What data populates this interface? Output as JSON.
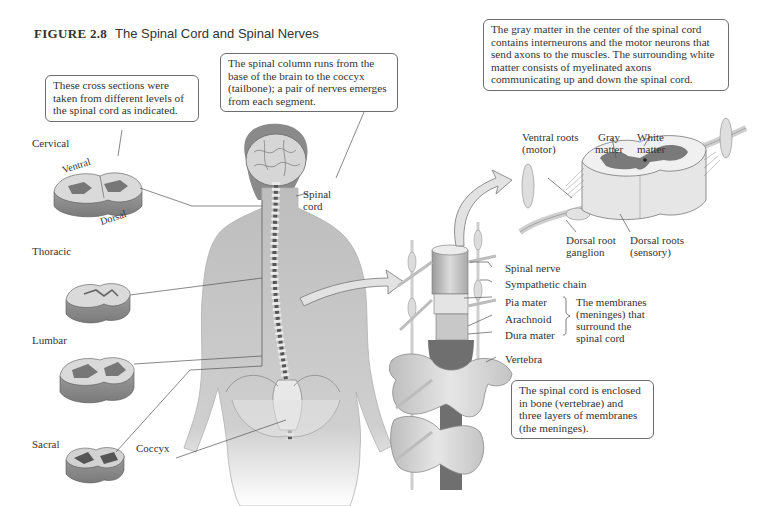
{
  "figure": {
    "number": "FIGURE 2.8",
    "title": "The Spinal Cord and Spinal Nerves"
  },
  "callouts": {
    "cross_sections": "These cross sections were taken from different levels of the spinal cord as indicated.",
    "spinal_column": "The spinal column runs from the base of the brain to the coccyx (tailbone); a pair of nerves emerges from each segment.",
    "gray_white_matter": "The gray matter in the center of the spinal cord contains interneurons and the motor neurons that send axons to the muscles. The surrounding white matter consists of myelinated axons communicating up and down the spinal cord.",
    "enclosure": "The spinal cord is enclosed in bone (vertebrae) and three layers of membranes (the meninges)."
  },
  "levels": {
    "cervical": "Cervical",
    "thoracic": "Thoracic",
    "lumbar": "Lumbar",
    "sacral": "Sacral"
  },
  "orientation": {
    "ventral": "Ventral",
    "dorsal": "Dorsal"
  },
  "body_labels": {
    "spinal_cord_1": "Spinal",
    "spinal_cord_2": "cord",
    "coccyx": "Coccyx"
  },
  "cord_section_labels": {
    "ventral_roots_1": "Ventral roots",
    "ventral_roots_2": "(motor)",
    "gray_matter_1": "Gray",
    "gray_matter_2": "matter",
    "white_matter_1": "White",
    "white_matter_2": "matter",
    "drg_1": "Dorsal root",
    "drg_2": "ganglion",
    "dorsal_roots_1": "Dorsal roots",
    "dorsal_roots_2": "(sensory)"
  },
  "column_labels": {
    "spinal_nerve": "Spinal nerve",
    "sympathetic_chain": "Sympathetic chain",
    "pia_mater": "Pia mater",
    "arachnoid": "Arachnoid",
    "dura_mater": "Dura mater",
    "vertebra": "Vertebra",
    "meninges_1": "The membranes",
    "meninges_2": "(meninges) that",
    "meninges_3": "surround the",
    "meninges_4": "spinal cord"
  },
  "colors": {
    "skin": "#c9c9c9",
    "skin_dark": "#9e9e9e",
    "section_top": "#d8d8d8",
    "section_side": "#8a8a8a",
    "gray_matter": "#7a7a7a",
    "bone": "#dcdcdc",
    "dura": "#6f6f6f",
    "leader_line": "#555555"
  }
}
